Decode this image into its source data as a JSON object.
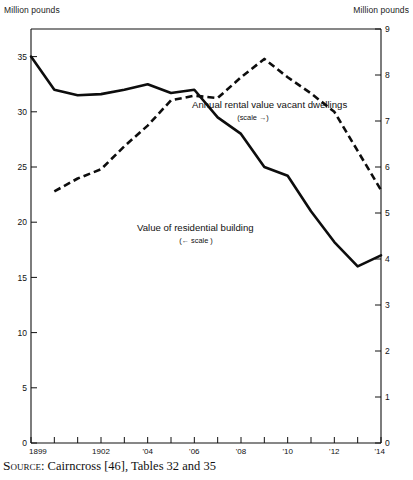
{
  "figure": {
    "unit_label_left": "Million pounds",
    "unit_label_right": "Million pounds",
    "source_prefix": "Source",
    "source_text": ": Cairncross [46], Tables 32 and 35"
  },
  "chart_data": {
    "type": "line",
    "title": "",
    "xlabel": "",
    "grid": false,
    "legend": "inline-annotations",
    "x": [
      1899,
      1900,
      1901,
      1902,
      1903,
      1904,
      1905,
      1906,
      1907,
      1908,
      1909,
      1910,
      1911,
      1912,
      1913,
      1914
    ],
    "xtick_labels": [
      "1899",
      "",
      "",
      "1902",
      "",
      "'04",
      "",
      "'06",
      "",
      "'08",
      "",
      "'10",
      "",
      "'12",
      "",
      "'14"
    ],
    "xlim": [
      1899,
      1914
    ],
    "left_axis": {
      "label": "Million pounds",
      "ylim": [
        0,
        37.5
      ],
      "ticks": [
        0,
        5,
        10,
        15,
        20,
        25,
        30,
        35
      ],
      "tick_labels": [
        "0",
        "5",
        "10",
        "15",
        "20",
        "25",
        "30",
        "35"
      ]
    },
    "right_axis": {
      "label": "Million pounds",
      "ylim": [
        0,
        9
      ],
      "ticks": [
        0,
        1,
        2,
        3,
        4,
        5,
        6,
        7,
        8,
        9
      ],
      "tick_labels": [
        "0",
        "1",
        "2",
        "3",
        "4",
        "5",
        "6",
        "7",
        "8",
        "9"
      ]
    },
    "series": [
      {
        "name": "Value of residential building",
        "annotation": "Value of residential building",
        "annotation_sub": "(← scale )",
        "style": "solid",
        "axis": "left",
        "x": [
          1899,
          1900,
          1901,
          1902,
          1903,
          1904,
          1905,
          1906,
          1907,
          1908,
          1909,
          1910,
          1911,
          1912,
          1913,
          1914
        ],
        "values": [
          35.0,
          32.0,
          31.5,
          31.6,
          32.0,
          32.5,
          31.7,
          32.0,
          29.5,
          28.0,
          25.0,
          24.2,
          21.0,
          18.2,
          16.0,
          17.0
        ]
      },
      {
        "name": "Annual rental value vacant dwellings",
        "annotation": "Annual rental value vacant dwellings",
        "annotation_sub": "(scale →)",
        "style": "dashed",
        "axis": "right",
        "x": [
          1900,
          1901,
          1902,
          1903,
          1904,
          1905,
          1906,
          1907,
          1908,
          1909,
          1910,
          1911,
          1912,
          1913,
          1914
        ],
        "values": [
          5.47,
          5.75,
          5.95,
          6.45,
          6.9,
          7.45,
          7.55,
          7.5,
          7.95,
          8.35,
          7.95,
          7.6,
          7.2,
          6.35,
          5.5
        ]
      }
    ]
  }
}
